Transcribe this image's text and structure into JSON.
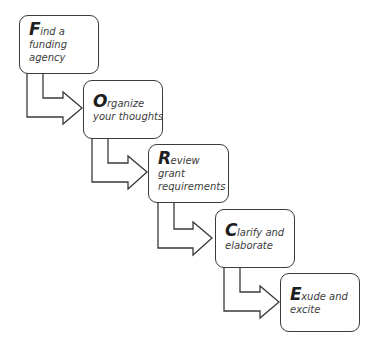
{
  "diagram": {
    "colors": {
      "border": "#3a3a3a",
      "text": "#3c3c3c",
      "initial": "#1e1e1e",
      "background": "#ffffff"
    },
    "steps": [
      {
        "initial": "F",
        "first_line_rest": "ind a",
        "lines": [
          "funding",
          "agency"
        ],
        "box": {
          "x": 19,
          "y": 15,
          "w": 80,
          "h": 59
        }
      },
      {
        "initial": "O",
        "first_line_rest": "rganize",
        "lines": [
          "your thoughts"
        ],
        "box": {
          "x": 83,
          "y": 80,
          "w": 80,
          "h": 59
        }
      },
      {
        "initial": "R",
        "first_line_rest": "eview",
        "lines": [
          "grant",
          "requirements"
        ],
        "box": {
          "x": 148,
          "y": 144,
          "w": 81,
          "h": 59
        }
      },
      {
        "initial": "C",
        "first_line_rest": "larify and",
        "lines": [
          "elaborate"
        ],
        "box": {
          "x": 215,
          "y": 209,
          "w": 80,
          "h": 59
        }
      },
      {
        "initial": "E",
        "first_line_rest": "xude and",
        "lines": [
          "excite"
        ],
        "box": {
          "x": 280,
          "y": 273,
          "w": 80,
          "h": 59
        }
      }
    ],
    "connectors": [
      {
        "from": "F",
        "to": "O",
        "shape": "bent-arrow"
      },
      {
        "from": "O",
        "to": "R",
        "shape": "bent-arrow"
      },
      {
        "from": "R",
        "to": "C",
        "shape": "bent-arrow"
      },
      {
        "from": "C",
        "to": "E",
        "shape": "bent-arrow"
      }
    ]
  }
}
